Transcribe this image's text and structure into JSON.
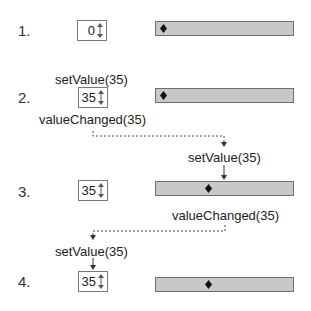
{
  "steps": [
    {
      "number": "1.",
      "spinbox_value": "0",
      "slider_position": 0,
      "slider_value": 0
    },
    {
      "number": "2.",
      "spinbox_value": "35",
      "slider_position": 0,
      "slider_value": 0
    },
    {
      "number": "3.",
      "spinbox_value": "35",
      "slider_position": 35,
      "slider_value": 35
    },
    {
      "number": "4.",
      "spinbox_value": "35",
      "slider_position": 35,
      "slider_value": 35
    }
  ],
  "annotations": {
    "set_value_1": "setValue(35)",
    "value_changed_1": "valueChanged(35)",
    "set_value_2": "setValue(35)",
    "value_changed_2": "valueChanged(35)",
    "set_value_3": "setValue(35)"
  },
  "icons": {
    "spin_arrows": "up-down-arrows-icon",
    "slider_handle": "diamond-icon"
  },
  "colors": {
    "slider_fill": "#c8c8c8",
    "slider_border": "#6e6e6e",
    "line": "#333333"
  }
}
